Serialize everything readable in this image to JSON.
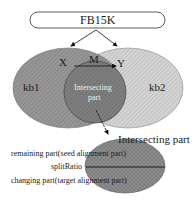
{
  "diagram": {
    "root_node": {
      "label": "FB15K"
    },
    "sets": [
      {
        "id": "kb1",
        "label": "kb1",
        "color": "#8a8a8a"
      },
      {
        "id": "kb2",
        "label": "kb2",
        "color": "#c9c9c9"
      }
    ],
    "intersection": {
      "label_line1": "Intersecting",
      "label_line2": "part",
      "color": "#7a7a7a"
    },
    "mapping": {
      "source": "X",
      "relation": "M",
      "target": "Y"
    },
    "detail": {
      "title": "Intersecting part",
      "color": "#8c8c8c",
      "upper_label": "remaining part(seed alignment part)",
      "divider_label": "splitRatio",
      "lower_label": "changing part(target alignment part)"
    }
  }
}
